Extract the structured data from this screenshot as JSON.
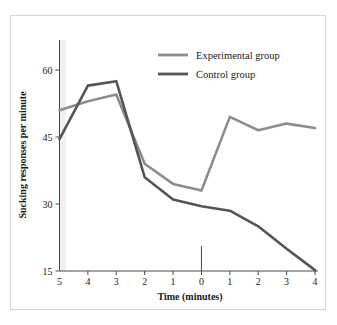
{
  "figure": {
    "background_color": "#ffffff",
    "frame_color": "#d8d8d8",
    "plot_band_color": "#f0f0f0"
  },
  "legend": {
    "position": "top-right",
    "entries": [
      {
        "label": "Experimental group",
        "color": "#8d8d8d"
      },
      {
        "label": "Control group",
        "color": "#555555"
      }
    ]
  },
  "chart_data": {
    "type": "line",
    "title": "",
    "xlabel": "Time (minutes)",
    "ylabel": "Sucking responses per minute",
    "x": [
      -5,
      -4,
      -3,
      -2,
      -1,
      0,
      1,
      2,
      3,
      4
    ],
    "xticklabels": [
      "5",
      "4",
      "3",
      "2",
      "1",
      "0",
      "1",
      "2",
      "3",
      "4"
    ],
    "xlim": [
      -5,
      4
    ],
    "ylim": [
      15,
      65
    ],
    "yticks": [
      15,
      30,
      45,
      60
    ],
    "yticklabels": [
      "15",
      "30",
      "45",
      "60"
    ],
    "grid": false,
    "annotations": [
      {
        "type": "vertical-marker",
        "x": 0,
        "note": "time zero reference tick"
      }
    ],
    "series": [
      {
        "name": "Experimental group",
        "color": "#8d8d8d",
        "values": [
          51,
          53,
          54.5,
          39,
          34.5,
          33,
          49.5,
          46.5,
          48,
          47
        ]
      },
      {
        "name": "Control group",
        "color": "#555555",
        "values": [
          44.5,
          56.5,
          57.5,
          36,
          31,
          29.5,
          28.5,
          25,
          20,
          15.2
        ]
      }
    ]
  }
}
